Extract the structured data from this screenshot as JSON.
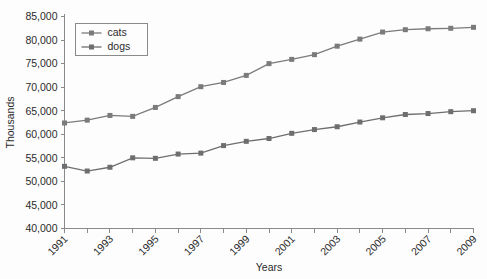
{
  "chart_data": {
    "type": "line",
    "title": "",
    "xlabel": "Years",
    "ylabel": "Thousands",
    "ylim": [
      40000,
      85000
    ],
    "ytick_step": 5000,
    "ytick_labels": [
      "85,000",
      "80,000",
      "75,000",
      "70,000",
      "65,000",
      "60,000",
      "55,000",
      "50,000",
      "45,000",
      "40,000"
    ],
    "ytick_values": [
      85000,
      80000,
      75000,
      70000,
      65000,
      60000,
      55000,
      50000,
      45000,
      40000
    ],
    "x": [
      1991,
      1992,
      1993,
      1994,
      1995,
      1996,
      1997,
      1998,
      1999,
      2000,
      2001,
      2002,
      2003,
      2004,
      2005,
      2006,
      2007,
      2008,
      2009
    ],
    "categories": [
      "1991",
      "1992",
      "1993",
      "1994",
      "1995",
      "1996",
      "1997",
      "1998",
      "1999",
      "2000",
      "2001",
      "2002",
      "2003",
      "2004",
      "2005",
      "2006",
      "2007",
      "2008",
      "2009"
    ],
    "xtick_labels_shown": [
      "1991",
      "1993",
      "1995",
      "1997",
      "1999",
      "2001",
      "2003",
      "2005",
      "2007",
      "2009"
    ],
    "xlim": [
      1991,
      2009
    ],
    "grid": false,
    "legend_position": "upper-left-inside",
    "series": [
      {
        "name": "cats",
        "color": "#7b7b7b",
        "marker": "square",
        "values": [
          62400,
          63000,
          64000,
          63800,
          65700,
          68000,
          70100,
          71000,
          72500,
          75000,
          75900,
          76900,
          78700,
          80200,
          81700,
          82200,
          82400,
          82500,
          82700
        ]
      },
      {
        "name": "dogs",
        "color": "#6e6e6e",
        "marker": "square",
        "values": [
          53200,
          52200,
          53000,
          55000,
          54900,
          55800,
          56000,
          57600,
          58500,
          59100,
          60200,
          61000,
          61600,
          62600,
          63500,
          64200,
          64400,
          64800,
          65000
        ]
      }
    ]
  },
  "legend": {
    "entries": [
      {
        "label": "cats"
      },
      {
        "label": "dogs"
      }
    ]
  },
  "axes": {
    "y_title": "Thousands",
    "x_title": "Years"
  },
  "colors": {
    "cats": "#7b7b7b",
    "dogs": "#6e6e6e",
    "axis": "#8a8a8a",
    "text": "#2b2b2b",
    "background": "#fdfdfd"
  }
}
